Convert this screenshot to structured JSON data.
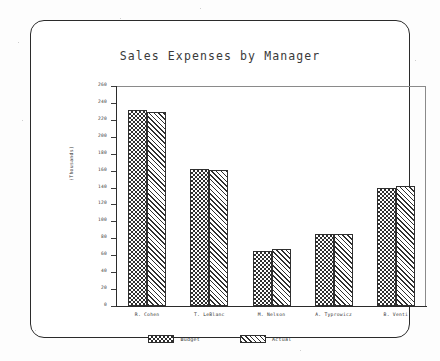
{
  "chart_data": {
    "type": "bar",
    "title": "Sales Expenses by Manager",
    "xlabel": "",
    "ylabel": "(Thousands)",
    "categories": [
      "R. Cohen",
      "T. LeBlanc",
      "M. Nelson",
      "A. Typrowicz",
      "B. Venti"
    ],
    "series": [
      {
        "name": "Budget",
        "values": [
          232,
          162,
          65,
          85,
          139
        ],
        "pattern": "checkerboard",
        "color": "#2f2f2f"
      },
      {
        "name": "Actual",
        "values": [
          229,
          161,
          67,
          85,
          142
        ],
        "pattern": "diagonal-hatch",
        "color": "#2f2f2f"
      }
    ],
    "ylim": [
      0,
      260
    ],
    "ytick_step": 20,
    "yticks": [
      260,
      240,
      220,
      200,
      180,
      160,
      140,
      120,
      100,
      80,
      60,
      40,
      20,
      0
    ],
    "ytick_labels": [
      "260",
      "240",
      "220",
      "200",
      "180",
      "160",
      "140",
      "120",
      "100",
      "80",
      "60",
      "40",
      "20",
      "0"
    ],
    "grid": false,
    "legend_position": "bottom",
    "grouped": true
  },
  "frame": {
    "border_color": "#2b2b2b",
    "background": "#ffffff"
  },
  "legend": {
    "items": [
      {
        "label": "Budget"
      },
      {
        "label": "Actual"
      }
    ]
  }
}
